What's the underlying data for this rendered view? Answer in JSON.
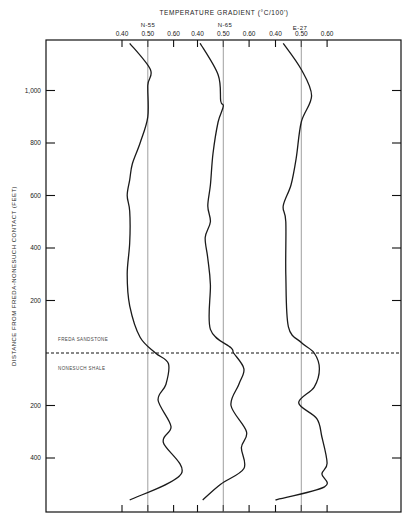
{
  "chart_data": {
    "type": "line",
    "title": "TEMPERATURE GRADIENT (°C/100')",
    "xlabel": "TEMPERATURE GRADIENT (°C/100')",
    "ylabel": "DISTANCE FROM FREDA-NONESUCH CONTACT (FEET)",
    "grid": false,
    "legend_position": "none",
    "reference_line": {
      "label_above": "FREDA SANDSTONE",
      "label_below": "NONESUCH SHALE",
      "style": "dashed",
      "y": 0
    },
    "y_ticks_above_contact": [
      "1,000",
      "800",
      "600",
      "400",
      "200"
    ],
    "y_ticks_below_contact": [
      "200",
      "400"
    ],
    "y_note": "Distance measured upward (Freda Sandstone) and downward (Nonesuch Shale) from the contact",
    "series": [
      {
        "name": "N-55",
        "x_ticks": [
          "0.40",
          "0.50",
          "0.60"
        ],
        "reference_value": 0.5,
        "points": [
          {
            "d": 1180,
            "g": 0.43
          },
          {
            "d": 1080,
            "g": 0.51
          },
          {
            "d": 1020,
            "g": 0.5
          },
          {
            "d": 900,
            "g": 0.5
          },
          {
            "d": 800,
            "g": 0.47
          },
          {
            "d": 720,
            "g": 0.44
          },
          {
            "d": 660,
            "g": 0.43
          },
          {
            "d": 600,
            "g": 0.42
          },
          {
            "d": 540,
            "g": 0.43
          },
          {
            "d": 420,
            "g": 0.43
          },
          {
            "d": 300,
            "g": 0.42
          },
          {
            "d": 180,
            "g": 0.43
          },
          {
            "d": 60,
            "g": 0.47
          },
          {
            "d": 0,
            "g": 0.53
          },
          {
            "d": -40,
            "g": 0.58
          },
          {
            "d": -120,
            "g": 0.57
          },
          {
            "d": -180,
            "g": 0.54
          },
          {
            "d": -280,
            "g": 0.59
          },
          {
            "d": -340,
            "g": 0.56
          },
          {
            "d": -460,
            "g": 0.63
          },
          {
            "d": -560,
            "g": 0.43
          }
        ]
      },
      {
        "name": "N-65",
        "x_ticks": [
          "0.40",
          "0.50",
          "0.60"
        ],
        "reference_value": 0.5,
        "points": [
          {
            "d": 1180,
            "g": 0.41
          },
          {
            "d": 1060,
            "g": 0.48
          },
          {
            "d": 960,
            "g": 0.49
          },
          {
            "d": 940,
            "g": 0.5
          },
          {
            "d": 880,
            "g": 0.48
          },
          {
            "d": 760,
            "g": 0.46
          },
          {
            "d": 640,
            "g": 0.45
          },
          {
            "d": 560,
            "g": 0.44
          },
          {
            "d": 500,
            "g": 0.45
          },
          {
            "d": 440,
            "g": 0.43
          },
          {
            "d": 360,
            "g": 0.44
          },
          {
            "d": 260,
            "g": 0.45
          },
          {
            "d": 90,
            "g": 0.45
          },
          {
            "d": 20,
            "g": 0.53
          },
          {
            "d": 0,
            "g": 0.54
          },
          {
            "d": -60,
            "g": 0.58
          },
          {
            "d": -120,
            "g": 0.56
          },
          {
            "d": -200,
            "g": 0.53
          },
          {
            "d": -300,
            "g": 0.59
          },
          {
            "d": -360,
            "g": 0.57
          },
          {
            "d": -440,
            "g": 0.58
          },
          {
            "d": -500,
            "g": 0.49
          },
          {
            "d": -560,
            "g": 0.42
          }
        ]
      },
      {
        "name": "E-27",
        "x_ticks": [
          "0.40",
          "0.50",
          "0.60"
        ],
        "reference_value": 0.5,
        "points": [
          {
            "d": 1180,
            "g": 0.43
          },
          {
            "d": 1080,
            "g": 0.5
          },
          {
            "d": 980,
            "g": 0.54
          },
          {
            "d": 880,
            "g": 0.5
          },
          {
            "d": 740,
            "g": 0.48
          },
          {
            "d": 640,
            "g": 0.46
          },
          {
            "d": 560,
            "g": 0.43
          },
          {
            "d": 500,
            "g": 0.44
          },
          {
            "d": 300,
            "g": 0.44
          },
          {
            "d": 100,
            "g": 0.45
          },
          {
            "d": 40,
            "g": 0.5
          },
          {
            "d": 0,
            "g": 0.55
          },
          {
            "d": -60,
            "g": 0.57
          },
          {
            "d": -130,
            "g": 0.55
          },
          {
            "d": -190,
            "g": 0.49
          },
          {
            "d": -250,
            "g": 0.56
          },
          {
            "d": -320,
            "g": 0.58
          },
          {
            "d": -420,
            "g": 0.6
          },
          {
            "d": -460,
            "g": 0.58
          },
          {
            "d": -510,
            "g": 0.59
          },
          {
            "d": -560,
            "g": 0.4
          }
        ]
      }
    ]
  },
  "labels": {
    "title": "TEMPERATURE GRADIENT (°C/100')",
    "ylabel": "DISTANCE FROM FREDA-NONESUCH CONTACT (FEET)",
    "formation_above": "FREDA SANDSTONE",
    "formation_below": "NONESUCH SHALE",
    "wells": [
      "N-55",
      "N-65",
      "E-27"
    ],
    "y_ticks_above": [
      "1,000",
      "800",
      "600",
      "400",
      "200"
    ],
    "y_ticks_below": [
      "200",
      "400"
    ]
  },
  "colors": {
    "line": "#1a1a1a",
    "ref_line": "#777777",
    "frame": "#111111"
  }
}
